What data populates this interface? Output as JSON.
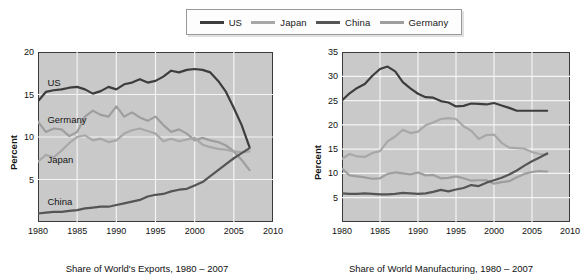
{
  "legend": {
    "items": [
      {
        "label": "US",
        "color": "#3d3d3d"
      },
      {
        "label": "Japan",
        "color": "#a8a8a8"
      },
      {
        "label": "China",
        "color": "#555555"
      },
      {
        "label": "Germany",
        "color": "#9e9e9e"
      }
    ]
  },
  "chart_data": [
    {
      "id": "exports",
      "type": "line",
      "title": "Share of World's Exports, 1980 – 2007",
      "xlabel": "",
      "ylabel": "Percent",
      "xlim": [
        1980,
        2010
      ],
      "ylim": [
        0,
        20
      ],
      "xticks": [
        1980,
        1985,
        1990,
        1995,
        2000,
        2005,
        2010
      ],
      "yticks": [
        5,
        10,
        15,
        20
      ],
      "grid": true,
      "legend_position": "top-center-shared",
      "annotations": [
        {
          "text": "US",
          "x": 1981.2,
          "y": 16.4
        },
        {
          "text": "Germany",
          "x": 1981.2,
          "y": 12.0
        },
        {
          "text": "Japan",
          "x": 1981.2,
          "y": 7.3
        },
        {
          "text": "China",
          "x": 1981.2,
          "y": 2.3
        }
      ],
      "x": [
        1980,
        1981,
        1982,
        1983,
        1984,
        1985,
        1986,
        1987,
        1988,
        1989,
        1990,
        1991,
        1992,
        1993,
        1994,
        1995,
        1996,
        1997,
        1998,
        1999,
        2000,
        2001,
        2002,
        2003,
        2004,
        2005,
        2006,
        2007
      ],
      "series": [
        {
          "name": "US",
          "color": "#3d3d3d",
          "width": 2.2,
          "values": [
            14.2,
            15.3,
            15.5,
            15.6,
            15.8,
            15.9,
            15.6,
            15.1,
            15.4,
            15.9,
            15.6,
            16.2,
            16.4,
            16.8,
            16.4,
            16.6,
            17.1,
            17.8,
            17.6,
            17.9,
            18.0,
            17.9,
            17.6,
            16.6,
            15.3,
            13.4,
            11.4,
            8.8
          ]
        },
        {
          "name": "Germany",
          "color": "#9e9e9e",
          "width": 2.2,
          "values": [
            11.8,
            10.6,
            11.0,
            10.9,
            10.1,
            10.6,
            12.4,
            13.1,
            12.6,
            12.4,
            13.6,
            12.4,
            12.9,
            12.3,
            11.9,
            12.4,
            11.4,
            10.6,
            10.9,
            10.4,
            9.6,
            9.9,
            9.6,
            9.4,
            9.0,
            8.3,
            7.3,
            6.1
          ]
        },
        {
          "name": "Japan",
          "color": "#a8a8a8",
          "width": 2.2,
          "values": [
            7.1,
            7.9,
            7.6,
            8.4,
            9.3,
            10.0,
            10.2,
            9.6,
            9.8,
            9.4,
            9.6,
            10.4,
            10.8,
            11.0,
            10.7,
            10.4,
            9.5,
            9.8,
            9.5,
            9.7,
            9.9,
            9.1,
            8.8,
            8.6,
            8.5,
            8.3,
            8.2,
            8.3
          ]
        },
        {
          "name": "China",
          "color": "#555555",
          "width": 2.2,
          "values": [
            1.0,
            1.1,
            1.2,
            1.2,
            1.3,
            1.4,
            1.6,
            1.7,
            1.8,
            1.8,
            2.0,
            2.2,
            2.4,
            2.6,
            3.0,
            3.2,
            3.3,
            3.6,
            3.8,
            3.9,
            4.3,
            4.7,
            5.4,
            6.1,
            6.8,
            7.5,
            8.1,
            8.7
          ]
        }
      ]
    },
    {
      "id": "manufacturing",
      "type": "line",
      "title": "Share of World Manufacturing, 1980 – 2007",
      "xlabel": "",
      "ylabel": "Percent",
      "xlim": [
        1980,
        2010
      ],
      "ylim": [
        0,
        35
      ],
      "xticks": [
        1980,
        1985,
        1990,
        1995,
        2000,
        2005,
        2010
      ],
      "yticks": [
        5,
        10,
        15,
        20,
        25,
        30,
        35
      ],
      "grid": true,
      "legend_position": "top-center-shared",
      "annotations": [],
      "x": [
        1980,
        1981,
        1982,
        1983,
        1984,
        1985,
        1986,
        1987,
        1988,
        1989,
        1990,
        1991,
        1992,
        1993,
        1994,
        1995,
        1996,
        1997,
        1998,
        1999,
        2000,
        2001,
        2002,
        2003,
        2004,
        2005,
        2006,
        2007
      ],
      "series": [
        {
          "name": "US",
          "color": "#3d3d3d",
          "width": 2.2,
          "values": [
            25.0,
            26.5,
            27.6,
            28.4,
            30.1,
            31.5,
            32.0,
            31.0,
            28.8,
            27.5,
            26.4,
            25.7,
            25.6,
            24.9,
            24.6,
            23.8,
            23.9,
            24.4,
            24.3,
            24.2,
            24.5,
            24.0,
            23.5,
            22.9,
            22.9,
            22.9,
            22.9,
            22.9
          ]
        },
        {
          "name": "Japan",
          "color": "#a8a8a8",
          "width": 2.2,
          "values": [
            13.0,
            14.0,
            13.5,
            13.4,
            14.2,
            14.6,
            16.6,
            17.6,
            19.0,
            18.3,
            18.6,
            19.9,
            20.5,
            21.2,
            21.4,
            21.2,
            19.7,
            18.8,
            17.1,
            17.9,
            18.0,
            16.3,
            15.3,
            15.2,
            15.1,
            14.4,
            14.0,
            13.9
          ]
        },
        {
          "name": "Germany",
          "color": "#9e9e9e",
          "width": 2.2,
          "values": [
            11.0,
            9.6,
            9.4,
            9.2,
            8.9,
            9.0,
            9.9,
            10.2,
            10.0,
            9.8,
            10.2,
            9.6,
            9.7,
            9.0,
            9.1,
            9.4,
            9.0,
            8.5,
            8.6,
            8.6,
            7.9,
            8.2,
            8.4,
            9.2,
            9.9,
            10.3,
            10.5,
            10.4
          ]
        },
        {
          "name": "China",
          "color": "#555555",
          "width": 2.2,
          "values": [
            5.9,
            5.8,
            5.8,
            5.9,
            5.8,
            5.7,
            5.7,
            5.8,
            6.0,
            5.9,
            5.8,
            5.9,
            6.2,
            6.6,
            6.3,
            6.7,
            7.0,
            7.6,
            7.4,
            8.1,
            8.6,
            9.1,
            9.8,
            10.6,
            11.6,
            12.5,
            13.3,
            14.1
          ]
        }
      ]
    }
  ]
}
